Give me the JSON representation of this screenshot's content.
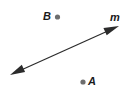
{
  "figure": {
    "type": "geometry-diagram",
    "background_color": "#ffffff",
    "stroke_color": "#2b2b2b",
    "label_color": "#1a1a1a",
    "width": 129,
    "height": 100,
    "line": {
      "name": "m",
      "label": "m",
      "label_position": {
        "x": 110,
        "y": 12
      },
      "start": {
        "x": 10,
        "y": 75
      },
      "end": {
        "x": 119,
        "y": 26
      },
      "arrowheads": "both",
      "stroke_width": 1.2
    },
    "points": [
      {
        "name": "B",
        "label": "B",
        "dot": {
          "x": 57.5,
          "y": 17
        },
        "dot_radius": 2.6,
        "dot_color": "#6e6e6e",
        "label_position": {
          "x": 43,
          "y": 11
        },
        "label_side": "left"
      },
      {
        "name": "A",
        "label": "A",
        "dot": {
          "x": 83,
          "y": 82
        },
        "dot_radius": 2.6,
        "dot_color": "#6e6e6e",
        "label_position": {
          "x": 88,
          "y": 76
        },
        "label_side": "right"
      }
    ]
  }
}
